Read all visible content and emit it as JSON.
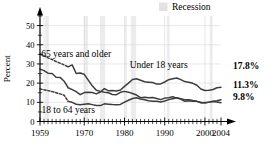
{
  "chart_data": {
    "type": "line",
    "title": "",
    "xlabel": "",
    "ylabel": "Percent",
    "xlim": [
      1959,
      2004
    ],
    "ylim": [
      0,
      55
    ],
    "yticks": [
      0,
      10,
      20,
      30,
      40,
      50
    ],
    "ytick_labels": [
      "0",
      "10",
      "20",
      "30",
      "40",
      "50"
    ],
    "xticks": [
      1959,
      1970,
      1980,
      1990,
      2000,
      2004
    ],
    "xtick_labels": [
      "1959",
      "1970",
      "1980",
      "1990",
      "2000",
      "2004"
    ],
    "grid": true,
    "legend": {
      "position": "top-right",
      "entries": [
        {
          "label": "Recession",
          "color": "#e3e3e3",
          "swatch": "band"
        }
      ]
    },
    "series": [
      {
        "name": "65 years and older",
        "label": "65 years and older",
        "end_value_label": "9.8%",
        "style": "dashed-then-solid",
        "color": "#3d3d3d",
        "x": [
          1959,
          1960,
          1961,
          1962,
          1963,
          1964,
          1965,
          1966,
          1967,
          1968,
          1969,
          1970,
          1971,
          1972,
          1973,
          1974,
          1975,
          1976,
          1977,
          1978,
          1979,
          1980,
          1981,
          1982,
          1983,
          1984,
          1985,
          1986,
          1987,
          1988,
          1989,
          1990,
          1991,
          1992,
          1993,
          1994,
          1995,
          1996,
          1997,
          1998,
          1999,
          2000,
          2001,
          2002,
          2003,
          2004
        ],
        "y": [
          35.2,
          34.2,
          33.2,
          32.3,
          31.3,
          30.4,
          29.5,
          28.5,
          29.5,
          25.0,
          25.3,
          24.6,
          21.6,
          18.6,
          16.3,
          15.7,
          15.3,
          15.0,
          14.1,
          14.0,
          15.2,
          15.7,
          15.3,
          14.6,
          13.8,
          12.4,
          12.6,
          12.4,
          12.5,
          12.0,
          11.4,
          12.2,
          12.4,
          12.9,
          12.2,
          11.7,
          10.5,
          10.8,
          10.5,
          10.5,
          9.7,
          9.9,
          10.1,
          10.4,
          10.2,
          9.8
        ]
      },
      {
        "name": "Under 18 years",
        "label": "Under 18 years",
        "end_value_label": "17.8%",
        "style": "solid",
        "color": "#3d3d3d",
        "x": [
          1959,
          1960,
          1961,
          1962,
          1963,
          1964,
          1965,
          1966,
          1967,
          1968,
          1969,
          1970,
          1971,
          1972,
          1973,
          1974,
          1975,
          1976,
          1977,
          1978,
          1979,
          1980,
          1981,
          1982,
          1983,
          1984,
          1985,
          1986,
          1987,
          1988,
          1989,
          1990,
          1991,
          1992,
          1993,
          1994,
          1995,
          1996,
          1997,
          1998,
          1999,
          2000,
          2001,
          2002,
          2003,
          2004
        ],
        "y": [
          27.3,
          26.5,
          25.2,
          25.0,
          23.1,
          23.0,
          21.0,
          17.6,
          16.6,
          15.6,
          14.0,
          15.1,
          15.3,
          15.1,
          14.4,
          15.4,
          17.1,
          16.0,
          16.2,
          15.9,
          16.4,
          18.3,
          20.0,
          21.9,
          22.3,
          21.5,
          20.7,
          20.5,
          20.3,
          19.5,
          19.6,
          20.6,
          21.8,
          22.3,
          22.7,
          21.8,
          20.8,
          20.5,
          19.9,
          18.9,
          16.9,
          16.2,
          16.3,
          16.7,
          17.6,
          17.8
        ]
      },
      {
        "name": "18 to 64 years",
        "label": "18 to 64 years",
        "end_value_label": "11.3%",
        "style": "dashed-then-solid",
        "color": "#3d3d3d",
        "x": [
          1959,
          1960,
          1961,
          1962,
          1963,
          1964,
          1965,
          1966,
          1967,
          1968,
          1969,
          1970,
          1971,
          1972,
          1973,
          1974,
          1975,
          1976,
          1977,
          1978,
          1979,
          1980,
          1981,
          1982,
          1983,
          1984,
          1985,
          1986,
          1987,
          1988,
          1989,
          1990,
          1991,
          1992,
          1993,
          1994,
          1995,
          1996,
          1997,
          1998,
          1999,
          2000,
          2001,
          2002,
          2003,
          2004
        ],
        "y": [
          17.0,
          16.5,
          16.1,
          15.6,
          15.0,
          14.4,
          13.7,
          10.5,
          10.0,
          9.0,
          8.7,
          9.0,
          9.3,
          8.8,
          8.3,
          8.3,
          9.2,
          9.0,
          8.8,
          8.7,
          8.9,
          10.1,
          11.1,
          12.0,
          12.4,
          11.7,
          11.3,
          10.8,
          10.6,
          10.5,
          10.2,
          10.7,
          11.4,
          11.9,
          12.4,
          11.9,
          11.4,
          11.4,
          10.9,
          10.5,
          10.0,
          9.6,
          10.1,
          10.6,
          10.8,
          11.3
        ]
      }
    ],
    "recession_bands": [
      {
        "start": 1960.3,
        "end": 1961.2
      },
      {
        "start": 1969.9,
        "end": 1970.9
      },
      {
        "start": 1973.9,
        "end": 1975.2
      },
      {
        "start": 1980.1,
        "end": 1980.6
      },
      {
        "start": 1981.6,
        "end": 1982.9
      },
      {
        "start": 1990.6,
        "end": 1991.2
      },
      {
        "start": 2001.2,
        "end": 2001.9
      }
    ],
    "annotations": [
      {
        "name": "label-65-and-older",
        "text": "65 years and older",
        "x": 1968.0,
        "y": 33.5
      },
      {
        "name": "label-under-18",
        "text": "Under 18 years",
        "x": 1988.5,
        "y": 28.0
      },
      {
        "name": "label-18-to-64",
        "text": "18 to 64 years",
        "x": 1966.0,
        "y": 4.5
      }
    ],
    "end_labels": [
      {
        "name": "end-label-under-18",
        "text": "17.8%",
        "value": 17.8
      },
      {
        "name": "end-label-18-to-64",
        "text": "11.3%",
        "value": 11.3
      },
      {
        "name": "end-label-65-and-older",
        "text": "9.8%",
        "value": 9.8
      }
    ]
  }
}
